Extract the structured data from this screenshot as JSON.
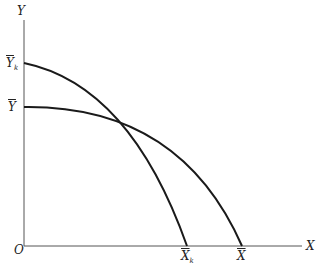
{
  "diagram": {
    "axes": {
      "x_label": "X",
      "y_label": "Y",
      "origin_label": "O"
    },
    "y_ticks": [
      {
        "label": "Y",
        "sub": "k",
        "y": 63
      },
      {
        "label": "Y",
        "sub": "",
        "y": 107
      }
    ],
    "x_ticks": [
      {
        "label": "X",
        "sub": "k",
        "x": 187
      },
      {
        "label": "X",
        "sub": "",
        "x": 242
      }
    ],
    "curves": [
      {
        "name": "frontier-k",
        "from": "Y_k",
        "to": "X_k"
      },
      {
        "name": "frontier",
        "from": "Y",
        "to": "X"
      }
    ],
    "colors": {
      "line": "#1a1a1a",
      "axis": "#555555"
    }
  }
}
